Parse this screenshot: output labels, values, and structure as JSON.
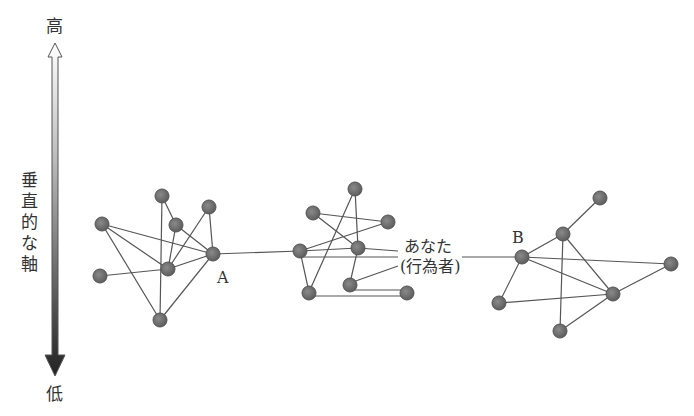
{
  "axis": {
    "high_label": "高",
    "low_label": "低",
    "title_chars": [
      "垂",
      "直",
      "的",
      "な",
      "軸"
    ]
  },
  "labels": {
    "node_a": "A",
    "node_b": "B",
    "actor_line1": "あなた",
    "actor_line2": "(行為者)"
  },
  "colors": {
    "node_fill": "#777777",
    "node_stroke": "#555555",
    "edge": "#555555"
  }
}
